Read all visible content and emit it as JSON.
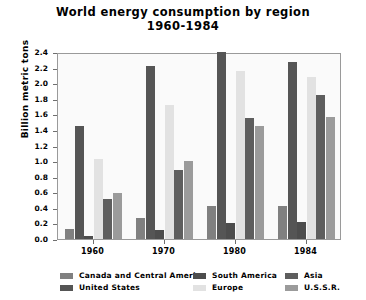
{
  "chart_data": {
    "type": "bar",
    "title": "World energy consumption by region",
    "subtitle": "1960-1984",
    "xlabel": "",
    "ylabel": "Billion metric tons",
    "categories": [
      "1960",
      "1970",
      "1980",
      "1984"
    ],
    "ylim": [
      0.0,
      2.4
    ],
    "ytick_labels": [
      "0.0",
      "0.2",
      "0.4",
      "0.6",
      "0.8",
      "1.0",
      "1.2",
      "1.4",
      "1.6",
      "1.8",
      "2.0",
      "2.2",
      "2.4"
    ],
    "ytick_values": [
      0.0,
      0.2,
      0.4,
      0.6,
      0.8,
      1.0,
      1.2,
      1.4,
      1.6,
      1.8,
      2.0,
      2.2,
      2.4
    ],
    "grid": false,
    "legend_position": "bottom",
    "series": [
      {
        "name": "Canada and Central America",
        "color": "#808080",
        "values": [
          0.13,
          0.27,
          0.43,
          0.42
        ]
      },
      {
        "name": "United States",
        "color": "#555555",
        "values": [
          1.45,
          2.22,
          2.4,
          2.27
        ]
      },
      {
        "name": "South America",
        "color": "#4d4d4d",
        "values": [
          0.04,
          0.12,
          0.2,
          0.22
        ]
      },
      {
        "name": "Europe",
        "color": "#e2e2e2",
        "values": [
          1.03,
          1.72,
          2.15,
          2.08
        ]
      },
      {
        "name": "Asia",
        "color": "#5e5e5e",
        "values": [
          0.51,
          0.88,
          1.55,
          1.85
        ]
      },
      {
        "name": "U.S.S.R.",
        "color": "#9b9b9b",
        "values": [
          0.59,
          1.0,
          1.45,
          1.57
        ]
      }
    ]
  },
  "legend": {
    "items": [
      {
        "label": "Canada and Central America",
        "color": "#808080"
      },
      {
        "label": "United States",
        "color": "#555555"
      },
      {
        "label": "South America",
        "color": "#4d4d4d"
      },
      {
        "label": "Europe",
        "color": "#e2e2e2"
      },
      {
        "label": "Asia",
        "color": "#5e5e5e"
      },
      {
        "label": "U.S.S.R.",
        "color": "#9b9b9b"
      }
    ]
  }
}
